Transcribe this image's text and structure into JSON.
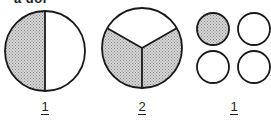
{
  "header": {
    "partial_text": "a dor"
  },
  "figures": [
    {
      "name": "circle-halves",
      "parts": 2,
      "shaded": 1,
      "fraction": {
        "numerator": "1",
        "denominator": "2"
      }
    },
    {
      "name": "circle-thirds",
      "parts": 3,
      "shaded": 2,
      "fraction": {
        "numerator": "2",
        "denominator": "3"
      }
    },
    {
      "name": "four-circles",
      "parts": 4,
      "shaded": 1,
      "fraction": {
        "numerator": "1",
        "denominator": "4"
      }
    }
  ],
  "colors": {
    "stroke": "#1a1a1a",
    "shade": "#c8c8c8",
    "background": "#ffffff"
  }
}
